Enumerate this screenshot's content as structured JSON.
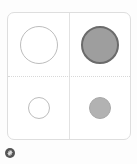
{
  "canvas": {
    "background_color": "#fdfdfd",
    "width": 137,
    "height": 164
  },
  "card": {
    "background_color": "#ffffff",
    "border_color": "#dedede",
    "divider_vertical_color": "#e2e2e2",
    "divider_horizontal_color": "#d8d8d8",
    "divider_horizontal_style": "dotted"
  },
  "matrix": {
    "rows": 2,
    "columns": 2,
    "cells": [
      {
        "position": "top-left",
        "shape": "circle",
        "size": "large",
        "diameter_px": 38,
        "fill": "none",
        "fill_color": "transparent",
        "stroke_color": "#bdbdbd",
        "stroke_width_px": 1
      },
      {
        "position": "top-right",
        "shape": "circle",
        "size": "large",
        "diameter_px": 38,
        "fill": "solid",
        "fill_color": "#9e9e9e",
        "stroke_color": "#6b6b6b",
        "stroke_width_px": 2
      },
      {
        "position": "bottom-left",
        "shape": "circle",
        "size": "small",
        "diameter_px": 22,
        "fill": "none",
        "fill_color": "transparent",
        "stroke_color": "#bdbdbd",
        "stroke_width_px": 1
      },
      {
        "position": "bottom-right",
        "shape": "circle",
        "size": "small",
        "diameter_px": 22,
        "fill": "solid",
        "fill_color": "#b2b2b2",
        "stroke_color": "#a8a8a8",
        "stroke_width_px": 1
      }
    ]
  },
  "badge": {
    "icon": "gear-icon",
    "background_color": "#555555",
    "glyph_color": "#dddddd",
    "diameter_px": 10
  }
}
